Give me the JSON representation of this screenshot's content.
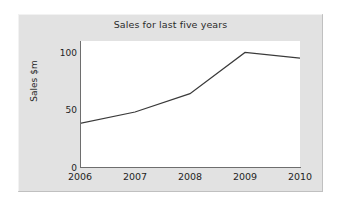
{
  "chart_data": {
    "type": "line",
    "title": "Sales for last five years",
    "xlabel": "",
    "ylabel": "Sales $m",
    "categories": [
      "2006",
      "2007",
      "2008",
      "2009",
      "2010"
    ],
    "x": [
      2006,
      2007,
      2008,
      2009,
      2010
    ],
    "values": [
      38,
      48,
      64,
      100,
      95
    ],
    "series": [
      {
        "name": "Sales",
        "values": [
          38,
          48,
          64,
          100,
          95
        ]
      }
    ],
    "ylim": [
      0,
      110
    ],
    "y_ticks": [
      0,
      50,
      100
    ],
    "y_tick_labels": [
      "0",
      "50",
      "100"
    ],
    "x_tick_labels": [
      "2006",
      "2007",
      "2008",
      "2009",
      "2010"
    ],
    "grid": false,
    "legend": false,
    "legend_position": "none",
    "markers": false,
    "line_color": "#3a3a3a",
    "plot_background": "#ffffff",
    "panel_background": "#e2e2e2",
    "axis_color": "#6e6e6e",
    "title_color": "#2b2b2b"
  }
}
